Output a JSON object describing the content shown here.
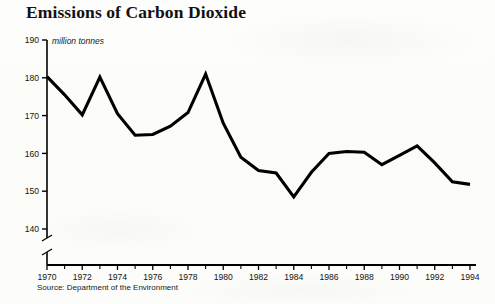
{
  "chart_data": {
    "type": "line",
    "title": "Emissions of Carbon Dioxide",
    "subtitle": "million tonnes",
    "ylabel": "million tonnes",
    "xlabel": "",
    "source": "Source:  Department of the Environment",
    "ylim": [
      140,
      190
    ],
    "y_ticks": [
      190,
      180,
      170,
      160,
      150,
      140
    ],
    "y_axis_break": true,
    "xlim": [
      1970,
      1994
    ],
    "x_ticks_major": [
      1970,
      1972,
      1974,
      1976,
      1978,
      1980,
      1982,
      1984,
      1986,
      1988,
      1990,
      1992,
      1994
    ],
    "x_ticks_minor": [
      1971,
      1973,
      1975,
      1977,
      1979,
      1981,
      1983,
      1985,
      1987,
      1989,
      1991,
      1993
    ],
    "grid": false,
    "legend": "none",
    "line_color": "#000000",
    "x": [
      1970,
      1971,
      1972,
      1973,
      1974,
      1975,
      1976,
      1977,
      1978,
      1979,
      1980,
      1981,
      1982,
      1983,
      1984,
      1985,
      1986,
      1987,
      1988,
      1989,
      1990,
      1991,
      1992,
      1993,
      1994
    ],
    "values": [
      180.3,
      175.5,
      170.2,
      180.2,
      170.5,
      164.8,
      165.0,
      167.2,
      170.8,
      181.0,
      168.0,
      159.0,
      155.5,
      154.8,
      148.5,
      155.0,
      160.0,
      160.5,
      160.3,
      157.0,
      159.5,
      162.0,
      157.5,
      152.5,
      151.8
    ]
  },
  "axis": {
    "y_tick_labels": [
      "190",
      "180",
      "170",
      "160",
      "150",
      "140"
    ],
    "x_tick_labels": [
      "1970",
      "1972",
      "1974",
      "1976",
      "1978",
      "1980",
      "1982",
      "1984",
      "1986",
      "1988",
      "1990",
      "1992",
      "1994"
    ]
  }
}
